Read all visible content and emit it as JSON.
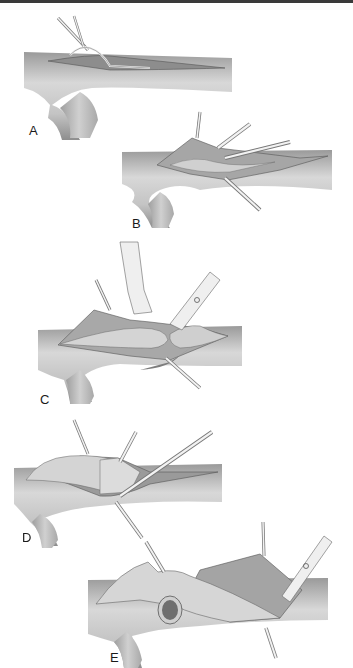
{
  "figure": {
    "panels": [
      {
        "label": "A",
        "description": "Vessel with initial longitudinal incision, stay sutures"
      },
      {
        "label": "B",
        "description": "Incision opened with multiple retracting sutures"
      },
      {
        "label": "C",
        "description": "Forceps and scissors dissecting plaque/intima"
      },
      {
        "label": "D",
        "description": "Flap elevated with stay sutures"
      },
      {
        "label": "E",
        "description": "Vessel transected, lumen visible, scissors trimming"
      }
    ],
    "colors": {
      "vessel_light": "#e6e6e6",
      "vessel_mid": "#bdbdbd",
      "vessel_dark": "#8a8a8a",
      "outline": "#555555",
      "instrument": "#f2f2f2"
    }
  }
}
